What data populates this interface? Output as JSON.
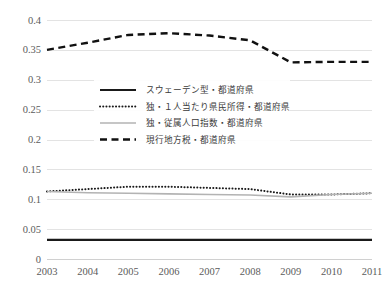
{
  "chart_data": {
    "type": "line",
    "title": "",
    "xlabel": "",
    "ylabel": "",
    "x": [
      2003,
      2004,
      2005,
      2006,
      2007,
      2008,
      2009,
      2010,
      2011
    ],
    "categories": [
      "2003",
      "2004",
      "2005",
      "2006",
      "2007",
      "2008",
      "2009",
      "2010",
      "2011"
    ],
    "xlim": [
      2003,
      2011
    ],
    "ylim": [
      0,
      0.4
    ],
    "y_ticks": [
      0,
      0.05,
      0.1,
      0.15,
      0.2,
      0.25,
      0.3,
      0.35,
      0.4
    ],
    "y_tick_labels": [
      "0",
      "0.05",
      "0.1",
      "0.15",
      "0.2",
      "0.25",
      "0.3",
      "0.35",
      "0.4"
    ],
    "grid": true,
    "legend_position": "center",
    "series": [
      {
        "name": "スウェーデン型・都道府県",
        "style": "solid-thick",
        "color": "#1a1a1a",
        "values": [
          0.032,
          0.032,
          0.032,
          0.032,
          0.032,
          0.032,
          0.032,
          0.032,
          0.032
        ]
      },
      {
        "name": "独・１人当たり県民所得・都道府県",
        "style": "dotted",
        "color": "#1a1a1a",
        "values": [
          0.113,
          0.117,
          0.121,
          0.121,
          0.119,
          0.117,
          0.108,
          0.108,
          0.11
        ]
      },
      {
        "name": "独・従属人口指数・都道府県",
        "style": "solid-gray",
        "color": "#b3b3b3",
        "values": [
          0.113,
          0.111,
          0.11,
          0.109,
          0.108,
          0.107,
          0.104,
          0.108,
          0.11
        ]
      },
      {
        "name": "現行地方税・都道府県",
        "style": "dashed",
        "color": "#111111",
        "values": [
          0.35,
          0.362,
          0.375,
          0.378,
          0.374,
          0.366,
          0.329,
          0.33,
          0.33
        ]
      }
    ]
  },
  "legend": {
    "entries": [
      {
        "label": "スウェーデン型・都道府県"
      },
      {
        "label": "独・１人当たり県民所得・都道府県"
      },
      {
        "label": "独・従属人口指数・都道府県"
      },
      {
        "label": "現行地方税・都道府県"
      }
    ]
  },
  "axes": {
    "y_labels": [
      "0.4",
      "0.35",
      "0.3",
      "0.25",
      "0.2",
      "0.15",
      "0.1",
      "0.05",
      "0"
    ],
    "x_labels": [
      "2003",
      "2004",
      "2005",
      "2006",
      "2007",
      "2008",
      "2009",
      "2010",
      "2011"
    ]
  },
  "colors": {
    "grid": "#e3e3e3",
    "baseline": "#d0d0d0",
    "series_sweden": "#1a1a1a",
    "series_income": "#1a1a1a",
    "series_dependency": "#b3b3b3",
    "series_current_tax": "#111111",
    "tick_text": "#5b5b5b",
    "legend_text": "#3a3a3a",
    "background": "#ffffff"
  }
}
